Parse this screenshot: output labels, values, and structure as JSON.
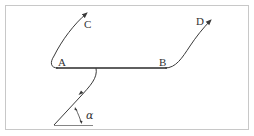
{
  "diagram": {
    "type": "trajectory-diagram",
    "colors": {
      "background": "#ffffff",
      "frame": "#c8c8c8",
      "stroke": "#3a3a3a",
      "surface": "#2a2a2a",
      "text": "#333333"
    },
    "points": {
      "A": {
        "label": "A",
        "x": 62,
        "y": 64
      },
      "B": {
        "label": "B",
        "x": 163,
        "y": 64
      },
      "C": {
        "label": "C",
        "x": 86,
        "y": 25
      },
      "D": {
        "label": "D",
        "x": 199,
        "y": 25
      }
    },
    "angle": {
      "label": "α"
    },
    "segments": [
      {
        "name": "surface-AB",
        "from": "A",
        "to": "B"
      },
      {
        "name": "path-A-to-C",
        "from": "A",
        "to": "C",
        "arrow": true
      },
      {
        "name": "path-B-to-D",
        "from": "B",
        "to": "D",
        "arrow": true
      },
      {
        "name": "incident-path",
        "from": "origin",
        "to": "AB-midpoint",
        "arrow_mid": true
      }
    ]
  }
}
